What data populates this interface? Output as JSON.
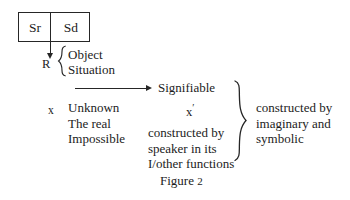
{
  "figure": {
    "caption_label": "Figure",
    "caption_number": "2",
    "background_color": "#ffffff",
    "ink_color": "#1c1c1c"
  },
  "sign_box": {
    "signifier_label": "Sr",
    "signified_label": "Sd"
  },
  "referent": {
    "label": "R",
    "brace_items": [
      "Object",
      "Situation"
    ],
    "brace_icon": "left-curly-brace-icon",
    "arrow_icon": "down-arrow-icon"
  },
  "signifiable": {
    "label": "Signifiable",
    "arrow_icon": "right-arrow-icon"
  },
  "unknown_column": {
    "marker": "x",
    "lines": [
      "Unknown",
      "The real",
      "Impossible"
    ]
  },
  "signifiable_column": {
    "marker": "x",
    "marker_prime": "′",
    "lines": [
      "constructed by",
      "speaker in its",
      "I/other functions"
    ]
  },
  "outer_brace": {
    "icon": "right-curly-brace-icon",
    "lines": [
      "constructed by",
      "imaginary and",
      "symbolic"
    ]
  }
}
